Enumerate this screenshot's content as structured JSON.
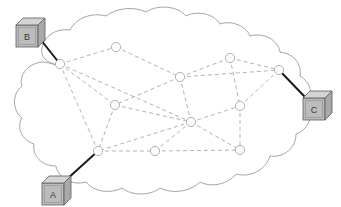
{
  "figure": {
    "background_color": "#ffffff",
    "cloud": {
      "outline_color": "#9a9a9a",
      "fill_color": "#ffffff",
      "stroke_width": 0.9
    },
    "link_style": {
      "internal_link_color": "#b4b4b4",
      "internal_link_dash": "4 3",
      "internal_link_width": 1,
      "access_link_color": "#1a1a1a",
      "access_link_width": 2
    },
    "router_style": {
      "radius": 4.6,
      "fill_color": "#fdfdfd",
      "stroke_color": "#a8a8a8",
      "stroke_width": 0.9
    },
    "host_style": {
      "face_fill": "#bcbcbc",
      "top_fill": "#d4d4d4",
      "side_fill": "#a9a9a9",
      "edge_color": "#5c5c5c",
      "label_color": "#3a3a3a",
      "label_font_size": 9
    }
  },
  "hosts": [
    {
      "id": "B",
      "label": "B",
      "x": 16,
      "y": 18,
      "width": 22,
      "height": 22,
      "depth": 7,
      "attaches_to": "r1",
      "link_from": {
        "x": 37,
        "y": 35
      },
      "link_to": {
        "x": 60,
        "y": 64
      }
    },
    {
      "id": "C",
      "label": "C",
      "x": 303,
      "y": 91,
      "width": 22,
      "height": 22,
      "depth": 7,
      "attaches_to": "r8",
      "link_from": {
        "x": 304,
        "y": 96
      },
      "link_to": {
        "x": 279,
        "y": 70
      }
    },
    {
      "id": "A",
      "label": "A",
      "x": 42,
      "y": 176,
      "width": 22,
      "height": 22,
      "depth": 7,
      "attaches_to": "r9",
      "link_from": {
        "x": 66,
        "y": 180
      },
      "link_to": {
        "x": 98,
        "y": 151
      }
    }
  ],
  "routers": [
    {
      "id": "r1",
      "x": 60,
      "y": 64
    },
    {
      "id": "r2",
      "x": 116,
      "y": 47
    },
    {
      "id": "r3",
      "x": 180,
      "y": 77
    },
    {
      "id": "r4",
      "x": 230,
      "y": 58
    },
    {
      "id": "r5",
      "x": 279,
      "y": 70
    },
    {
      "id": "r6",
      "x": 115,
      "y": 105
    },
    {
      "id": "r7",
      "x": 191,
      "y": 122
    },
    {
      "id": "r8",
      "x": 240,
      "y": 106
    },
    {
      "id": "r9",
      "x": 98,
      "y": 151
    },
    {
      "id": "r10",
      "x": 155,
      "y": 151
    },
    {
      "id": "r11",
      "x": 240,
      "y": 150
    }
  ],
  "links": [
    {
      "from": "r1",
      "to": "r2"
    },
    {
      "from": "r1",
      "to": "r6"
    },
    {
      "from": "r1",
      "to": "r7"
    },
    {
      "from": "r1",
      "to": "r9"
    },
    {
      "from": "r2",
      "to": "r3"
    },
    {
      "from": "r3",
      "to": "r4"
    },
    {
      "from": "r3",
      "to": "r5"
    },
    {
      "from": "r3",
      "to": "r6"
    },
    {
      "from": "r3",
      "to": "r7"
    },
    {
      "from": "r4",
      "to": "r5"
    },
    {
      "from": "r4",
      "to": "r8"
    },
    {
      "from": "r5",
      "to": "r8"
    },
    {
      "from": "r6",
      "to": "r7"
    },
    {
      "from": "r6",
      "to": "r9"
    },
    {
      "from": "r7",
      "to": "r8"
    },
    {
      "from": "r7",
      "to": "r9"
    },
    {
      "from": "r7",
      "to": "r10"
    },
    {
      "from": "r7",
      "to": "r11"
    },
    {
      "from": "r8",
      "to": "r11"
    },
    {
      "from": "r9",
      "to": "r10"
    },
    {
      "from": "r10",
      "to": "r11"
    }
  ],
  "cloud_path": "M 62 66 C 48 64 40 58 42 48 C 44 36 56 28 70 30 C 76 18 92 12 106 16 C 116 8 134 6 146 12 C 158 4 178 6 186 16 C 198 10 214 14 220 24 C 232 20 246 26 250 36 C 264 32 278 40 280 52 C 294 54 302 64 300 76 C 310 82 314 94 308 104 C 314 116 308 130 296 134 C 296 148 284 158 270 156 C 266 170 250 178 236 174 C 228 184 212 188 200 182 C 190 192 172 194 160 188 C 150 196 132 196 122 188 C 110 194 94 192 86 182 C 72 186 58 178 56 166 C 42 166 32 156 34 144 C 22 140 16 128 22 118 C 12 110 12 94 22 86 C 18 74 30 62 44 62 Z"
}
